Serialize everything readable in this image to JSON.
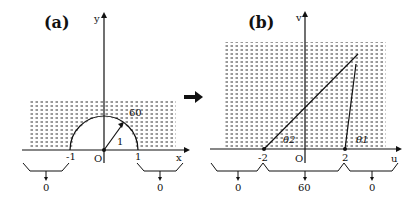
{
  "panel_a": {
    "label": "(a)",
    "x_axis": "x",
    "y_axis": "y",
    "origin": "O",
    "tick_left": "-1",
    "tick_right": "1",
    "radius_label": "1",
    "region_value": "60",
    "boundary_left": "0",
    "boundary_right": "0"
  },
  "panel_b": {
    "label": "(b)",
    "x_axis": "u",
    "y_axis": "v",
    "origin": "O",
    "tick_left": "-2",
    "tick_right": "2",
    "angle_2": "θ2",
    "angle_1": "θ1",
    "boundary_left": "0",
    "boundary_middle": "60",
    "boundary_right": "0"
  },
  "colors": {
    "ink": "#111111",
    "background": "#ffffff"
  }
}
